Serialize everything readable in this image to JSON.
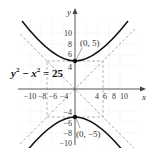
{
  "problem_number": "35.",
  "equation": {
    "lhs_var1": "y",
    "lhs_var2": "x",
    "exponent": "2",
    "minus": " − ",
    "equals": " = ",
    "rhs": "25"
  },
  "axes": {
    "x_label": "x",
    "y_label": "y",
    "x_ticks_neg": [
      "−10",
      "−8",
      "−6",
      "−4"
    ],
    "x_ticks_pos": [
      "4",
      "6",
      "8",
      "10"
    ],
    "y_ticks_pos": [
      "4",
      "6",
      "8",
      "10"
    ],
    "y_ticks_neg": [
      "−4",
      "−6",
      "−8",
      "−10"
    ]
  },
  "points": {
    "top_vertex": "(0, 5)",
    "bottom_vertex": "(0, −5)"
  },
  "colors": {
    "curve": "#111111",
    "axis": "#444444",
    "asymptote": "#999999",
    "grid": "#e6e6e6"
  }
}
